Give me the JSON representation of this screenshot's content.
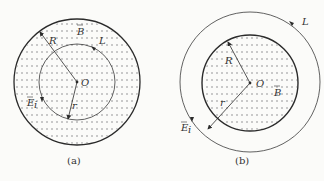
{
  "figures": [
    {
      "caption": "(a)",
      "labels": {
        "radius_R": "R",
        "radius_r": "r",
        "center": "O",
        "field_B": "B",
        "loop": "L",
        "field_E": "E",
        "field_E_sub": "i"
      },
      "description": "Circular magnetic field region of radius R (x-marked, into page); integration loop L of radius r inside the field region"
    },
    {
      "caption": "(b)",
      "labels": {
        "radius_R": "R",
        "radius_r": "r",
        "center": "O",
        "field_B": "B",
        "loop": "L",
        "field_E": "E",
        "field_E_sub": "i"
      },
      "description": "Circular magnetic field region of radius R (x-marked, into page); integration loop L of radius r outside the field region"
    }
  ],
  "colors": {
    "stroke": "#2b2b2b",
    "pattern": "#9a9a9a",
    "background": "#fbfbf9"
  }
}
